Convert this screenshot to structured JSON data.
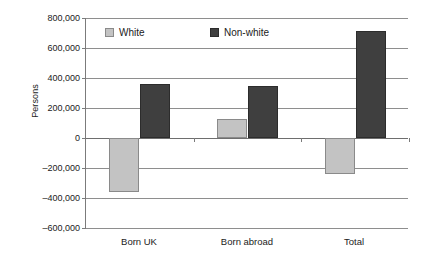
{
  "chart_data": {
    "type": "bar",
    "title": "",
    "subtitle": "",
    "xlabel": "",
    "ylabel": "Persons",
    "categories": [
      "Born UK",
      "Born abroad",
      "Total"
    ],
    "series": [
      {
        "name": "White",
        "color": "#c3c3c3",
        "values": [
          -360000,
          130000,
          -240000
        ]
      },
      {
        "name": "Non-white",
        "color": "#3f3f3f",
        "values": [
          360000,
          345000,
          715000
        ]
      }
    ],
    "ylim": [
      -600000,
      800000
    ],
    "ytick_values": [
      800000,
      600000,
      400000,
      200000,
      0,
      -200000,
      -400000,
      -600000
    ],
    "ytick_labels": [
      "800,000",
      "600,000",
      "400,000",
      "200,000",
      "0",
      "–200,000",
      "–400,000",
      "–600,000"
    ],
    "grid": true,
    "grid_axis": "y",
    "legend_position": "top-inside",
    "legend": [
      "White",
      "Non-white"
    ],
    "annotations": []
  },
  "axis": {
    "y_title": "Persons"
  }
}
